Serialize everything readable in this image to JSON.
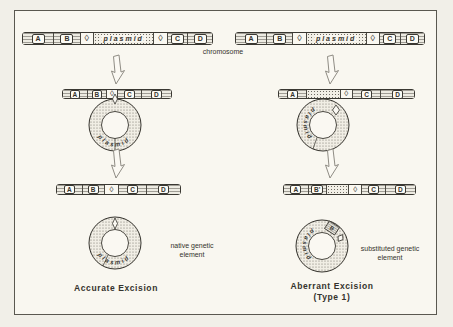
{
  "labels": {
    "chromosome": "chromosome"
  },
  "bars": {
    "top_left": [
      "A",
      "B",
      "◊",
      "plasmid",
      "◊",
      "C",
      "D"
    ],
    "top_right": [
      "A",
      "B",
      "◊",
      "plasmid",
      "◊",
      "C",
      "D"
    ],
    "mid_left": [
      "A",
      "B",
      "◊",
      "C",
      "D"
    ],
    "mid_right": [
      "A",
      "◊",
      "C",
      "D"
    ],
    "bottom_left": [
      "A",
      "B",
      "◊",
      "C",
      "D"
    ],
    "bottom_right": [
      "A",
      "B'",
      "◊",
      "C",
      "D"
    ]
  },
  "rings": {
    "word": "plasmid",
    "b_chip": "B"
  },
  "annotations": {
    "native_line1": "native genetic",
    "native_line2": "element",
    "substituted_line1": "substituted genetic",
    "substituted_line2": "element"
  },
  "captions": {
    "accurate": "Accurate Excision",
    "aberrant_line1": "Aberrant Excision",
    "aberrant_line2": "(Type 1)"
  },
  "colors": {
    "ink": "#35332d",
    "paper": "#f6f4ee"
  }
}
